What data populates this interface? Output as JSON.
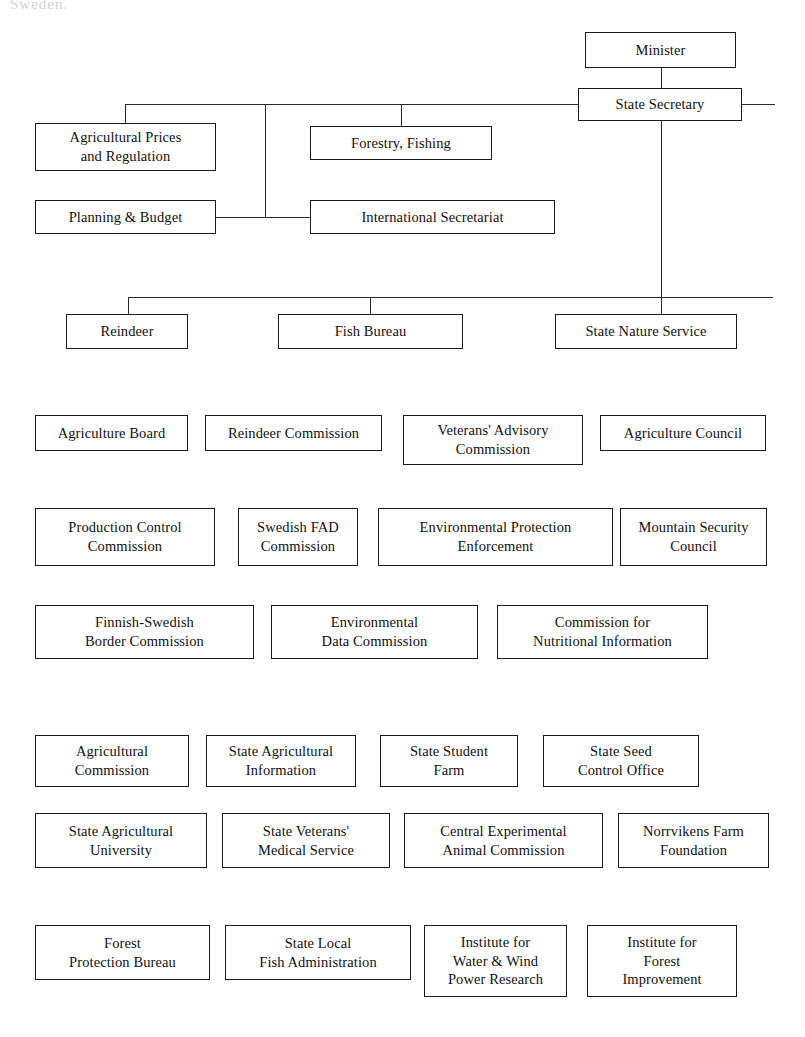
{
  "document": {
    "type": "organizational-chart",
    "subject": "Swedish Ministry of Agriculture organisation",
    "top_cut_text": "Sweden."
  },
  "boxes": [
    {
      "id": "minister",
      "label": "Minister",
      "x": 585,
      "y": 32,
      "w": 151,
      "h": 36
    },
    {
      "id": "state-secretary",
      "label": "State Secretary",
      "x": 578,
      "y": 88,
      "w": 164,
      "h": 33
    },
    {
      "id": "agricultural-prices",
      "label": "Agricultural Prices\nand Regulation",
      "x": 35,
      "y": 123,
      "w": 181,
      "h": 48
    },
    {
      "id": "forestry-fishing",
      "label": "Forestry, Fishing",
      "x": 310,
      "y": 126,
      "w": 182,
      "h": 34
    },
    {
      "id": "planning-budget",
      "label": "Planning & Budget",
      "x": 35,
      "y": 200,
      "w": 181,
      "h": 34
    },
    {
      "id": "international-secretariat",
      "label": "International Secretariat",
      "x": 310,
      "y": 200,
      "w": 245,
      "h": 34
    },
    {
      "id": "reindeer",
      "label": "Reindeer",
      "x": 66,
      "y": 314,
      "w": 122,
      "h": 35
    },
    {
      "id": "fish-bureau",
      "label": "Fish Bureau",
      "x": 278,
      "y": 314,
      "w": 185,
      "h": 35
    },
    {
      "id": "state-nature-service",
      "label": "State Nature Service",
      "x": 555,
      "y": 314,
      "w": 182,
      "h": 35
    },
    {
      "id": "agriculture-board",
      "label": "Agriculture Board",
      "x": 35,
      "y": 415,
      "w": 153,
      "h": 36
    },
    {
      "id": "reindeer-commission",
      "label": "Reindeer Commission",
      "x": 205,
      "y": 415,
      "w": 177,
      "h": 36
    },
    {
      "id": "veterans-advisory",
      "label": "Veterans' Advisory\nCommission",
      "x": 403,
      "y": 415,
      "w": 180,
      "h": 50
    },
    {
      "id": "agriculture-council",
      "label": "Agriculture Council",
      "x": 600,
      "y": 415,
      "w": 166,
      "h": 36
    },
    {
      "id": "production-control",
      "label": "Production Control\nCommission",
      "x": 35,
      "y": 508,
      "w": 180,
      "h": 58
    },
    {
      "id": "swedish-fad",
      "label": "Swedish FAD\nCommission",
      "x": 238,
      "y": 508,
      "w": 120,
      "h": 58
    },
    {
      "id": "environmental-protection",
      "label": "Environmental Protection\nEnforcement",
      "x": 378,
      "y": 508,
      "w": 235,
      "h": 58
    },
    {
      "id": "mountain-security",
      "label": "Mountain Security\nCouncil",
      "x": 620,
      "y": 508,
      "w": 147,
      "h": 58
    },
    {
      "id": "finnish-swedish-border",
      "label": "Finnish-Swedish\nBorder Commission",
      "x": 35,
      "y": 605,
      "w": 219,
      "h": 54
    },
    {
      "id": "environmental-data",
      "label": "Environmental\nData Commission",
      "x": 271,
      "y": 605,
      "w": 207,
      "h": 54
    },
    {
      "id": "nutritional-information",
      "label": "Commission for\nNutritional Information",
      "x": 497,
      "y": 605,
      "w": 211,
      "h": 54
    },
    {
      "id": "agricultural-commission",
      "label": "Agricultural\nCommission",
      "x": 35,
      "y": 735,
      "w": 154,
      "h": 52
    },
    {
      "id": "state-agricultural-info",
      "label": "State Agricultural\nInformation",
      "x": 206,
      "y": 735,
      "w": 150,
      "h": 52
    },
    {
      "id": "state-student-farm",
      "label": "State Student\nFarm",
      "x": 380,
      "y": 735,
      "w": 138,
      "h": 52
    },
    {
      "id": "state-seed-control",
      "label": "State Seed\nControl Office",
      "x": 543,
      "y": 735,
      "w": 156,
      "h": 52
    },
    {
      "id": "state-agricultural-univ",
      "label": "State Agricultural\nUniversity",
      "x": 35,
      "y": 813,
      "w": 172,
      "h": 55
    },
    {
      "id": "state-veterans-medical",
      "label": "State Veterans'\nMedical Service",
      "x": 222,
      "y": 813,
      "w": 168,
      "h": 55
    },
    {
      "id": "central-experimental-animal",
      "label": "Central Experimental\nAnimal Commission",
      "x": 404,
      "y": 813,
      "w": 199,
      "h": 55
    },
    {
      "id": "norrvikens-farm",
      "label": "Norrvikens Farm\nFoundation",
      "x": 618,
      "y": 813,
      "w": 151,
      "h": 55
    },
    {
      "id": "forest-protection",
      "label": "Forest\nProtection Bureau",
      "x": 35,
      "y": 925,
      "w": 175,
      "h": 55
    },
    {
      "id": "state-local-fish",
      "label": "State Local\nFish Administration",
      "x": 225,
      "y": 925,
      "w": 186,
      "h": 55
    },
    {
      "id": "institute-water-wind",
      "label": "Institute for\nWater & Wind\nPower Research",
      "x": 424,
      "y": 925,
      "w": 143,
      "h": 72
    },
    {
      "id": "institute-forest-improve",
      "label": "Institute for\nForest\nImprovement",
      "x": 587,
      "y": 925,
      "w": 150,
      "h": 72
    }
  ],
  "connectors": [
    {
      "id": "minister-to-secretary",
      "orient": "v",
      "x": 661,
      "y": 68,
      "len": 20
    },
    {
      "id": "secretary-right-stub",
      "orient": "h",
      "x": 742,
      "y": 104,
      "len": 33
    },
    {
      "id": "top-bus-horizontal",
      "orient": "h",
      "x": 125,
      "y": 104,
      "len": 453
    },
    {
      "id": "drop-agricultural-prices",
      "orient": "v",
      "x": 125,
      "y": 104,
      "len": 19
    },
    {
      "id": "drop-division-column",
      "orient": "v",
      "x": 265,
      "y": 104,
      "len": 113
    },
    {
      "id": "drop-forestry-fishing",
      "orient": "v",
      "x": 401,
      "y": 104,
      "len": 22
    },
    {
      "id": "planning-to-column",
      "orient": "h",
      "x": 216,
      "y": 217,
      "len": 50
    },
    {
      "id": "column-to-international",
      "orient": "h",
      "x": 265,
      "y": 217,
      "len": 46
    },
    {
      "id": "secretary-down-to-second-bus",
      "orient": "v",
      "x": 661,
      "y": 121,
      "len": 193
    },
    {
      "id": "second-bus-horizontal",
      "orient": "h",
      "x": 128,
      "y": 297,
      "len": 645
    },
    {
      "id": "drop-reindeer",
      "orient": "v",
      "x": 128,
      "y": 297,
      "len": 18
    },
    {
      "id": "drop-fish-bureau",
      "orient": "v",
      "x": 370,
      "y": 297,
      "len": 18
    }
  ]
}
